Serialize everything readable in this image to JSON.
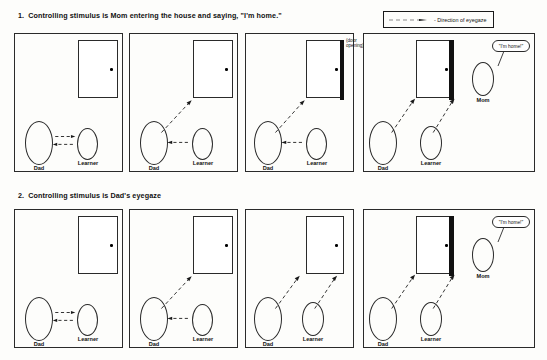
{
  "figure": {
    "legend": {
      "label": "- Direction of eyegaze",
      "icon": "dashed-arrow-icon"
    },
    "sections": [
      {
        "number": "1.",
        "title": "Controlling stimulus is Mom entering the house and saying, \"I'm home.\""
      },
      {
        "number": "2.",
        "title": "Controlling stimulus is Dad's eyegaze"
      }
    ],
    "labels": {
      "dad": "Dad",
      "learner": "Learner",
      "mom": "Mom",
      "door_opening_line1": "(door",
      "door_opening_line2": "opening)",
      "speech": "\"I'm home!\""
    },
    "colors": {
      "ink": "#1a1a1a",
      "paper": "#fdfdfb",
      "door_opening": "#111111"
    }
  }
}
